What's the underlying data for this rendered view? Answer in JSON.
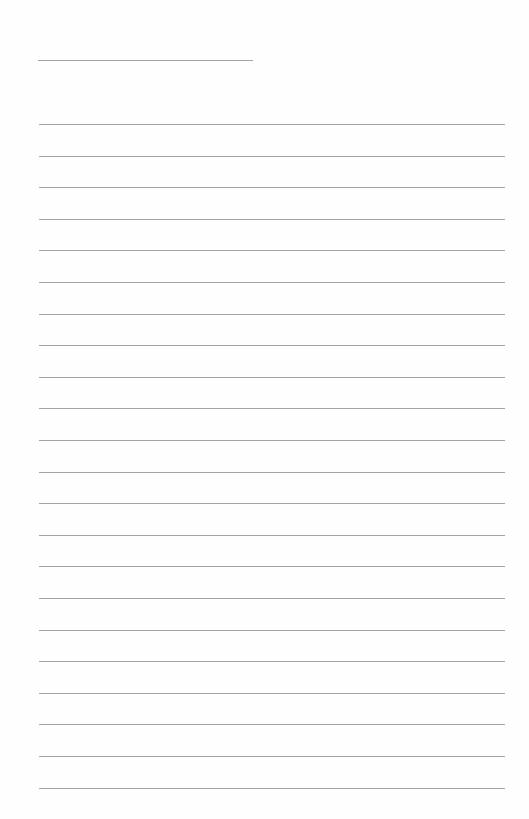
{
  "document": {
    "type": "lined-paper",
    "background_color": "#fefefe",
    "line_color": "#a3a3a3",
    "header_line": {
      "x": 38,
      "y": 60,
      "width": 215
    },
    "ruled_lines": {
      "count": 22,
      "x": 39,
      "width": 466,
      "first_y": 124,
      "spacing": 31.6
    },
    "text": ""
  }
}
